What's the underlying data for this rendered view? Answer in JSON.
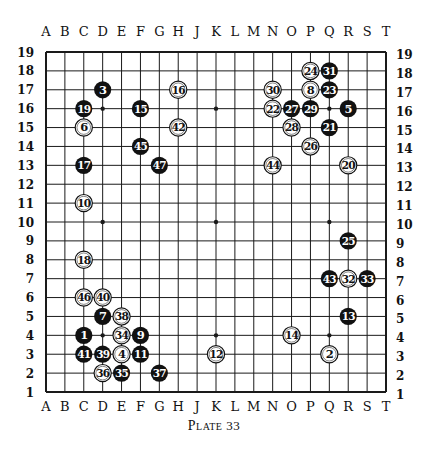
{
  "diagram": {
    "type": "go-board",
    "size": 19,
    "caption_word": "Plate",
    "caption_number": "33",
    "column_labels": [
      "A",
      "B",
      "C",
      "D",
      "E",
      "F",
      "G",
      "H",
      "J",
      "K",
      "L",
      "M",
      "N",
      "O",
      "P",
      "Q",
      "R",
      "S",
      "T"
    ],
    "row_labels": [
      "19",
      "18",
      "17",
      "16",
      "15",
      "14",
      "13",
      "12",
      "11",
      "10",
      "9",
      "8",
      "7",
      "6",
      "5",
      "4",
      "3",
      "2",
      "1"
    ],
    "star_points": [
      "D16",
      "K16",
      "Q16",
      "D10",
      "K10",
      "Q10",
      "D4",
      "K4",
      "Q4"
    ],
    "colors": {
      "line": "#1a1a1a",
      "black_stone": "#111111",
      "white_stone": "#ffffff",
      "background": "#ffffff"
    },
    "stones": [
      {
        "n": "1",
        "color": "black",
        "pos": "C4"
      },
      {
        "n": "2",
        "color": "white",
        "pos": "Q3"
      },
      {
        "n": "3",
        "color": "black",
        "pos": "D17"
      },
      {
        "n": "4",
        "color": "white",
        "pos": "E3"
      },
      {
        "n": "5",
        "color": "black",
        "pos": "R16"
      },
      {
        "n": "6",
        "color": "white",
        "pos": "C15"
      },
      {
        "n": "7",
        "color": "black",
        "pos": "D5"
      },
      {
        "n": "8",
        "color": "white",
        "pos": "P17"
      },
      {
        "n": "9",
        "color": "black",
        "pos": "F4"
      },
      {
        "n": "10",
        "color": "white",
        "pos": "C11"
      },
      {
        "n": "11",
        "color": "black",
        "pos": "F3"
      },
      {
        "n": "12",
        "color": "white",
        "pos": "K3"
      },
      {
        "n": "13",
        "color": "black",
        "pos": "R5"
      },
      {
        "n": "14",
        "color": "white",
        "pos": "O4"
      },
      {
        "n": "15",
        "color": "black",
        "pos": "F16"
      },
      {
        "n": "16",
        "color": "white",
        "pos": "H17"
      },
      {
        "n": "17",
        "color": "black",
        "pos": "C13"
      },
      {
        "n": "18",
        "color": "white",
        "pos": "C8"
      },
      {
        "n": "19",
        "color": "black",
        "pos": "C16"
      },
      {
        "n": "20",
        "color": "white",
        "pos": "R13"
      },
      {
        "n": "21",
        "color": "black",
        "pos": "Q15"
      },
      {
        "n": "22",
        "color": "white",
        "pos": "N16"
      },
      {
        "n": "23",
        "color": "black",
        "pos": "Q17"
      },
      {
        "n": "24",
        "color": "white",
        "pos": "P18"
      },
      {
        "n": "25",
        "color": "black",
        "pos": "R9"
      },
      {
        "n": "26",
        "color": "white",
        "pos": "P14"
      },
      {
        "n": "27",
        "color": "black",
        "pos": "O16"
      },
      {
        "n": "28",
        "color": "white",
        "pos": "O15"
      },
      {
        "n": "29",
        "color": "black",
        "pos": "P16"
      },
      {
        "n": "30",
        "color": "white",
        "pos": "N17"
      },
      {
        "n": "31",
        "color": "black",
        "pos": "Q18"
      },
      {
        "n": "32",
        "color": "white",
        "pos": "R7"
      },
      {
        "n": "33",
        "color": "black",
        "pos": "S7"
      },
      {
        "n": "34",
        "color": "white",
        "pos": "E4"
      },
      {
        "n": "35",
        "color": "black",
        "pos": "E2"
      },
      {
        "n": "36",
        "color": "white",
        "pos": "D2"
      },
      {
        "n": "37",
        "color": "black",
        "pos": "G2"
      },
      {
        "n": "38",
        "color": "white",
        "pos": "E5"
      },
      {
        "n": "39",
        "color": "black",
        "pos": "D3"
      },
      {
        "n": "40",
        "color": "white",
        "pos": "D6"
      },
      {
        "n": "41",
        "color": "black",
        "pos": "C3"
      },
      {
        "n": "42",
        "color": "white",
        "pos": "H15"
      },
      {
        "n": "43",
        "color": "black",
        "pos": "Q7"
      },
      {
        "n": "44",
        "color": "white",
        "pos": "N13"
      },
      {
        "n": "45",
        "color": "black",
        "pos": "F14"
      },
      {
        "n": "46",
        "color": "white",
        "pos": "C6"
      },
      {
        "n": "47",
        "color": "black",
        "pos": "G13"
      }
    ]
  }
}
